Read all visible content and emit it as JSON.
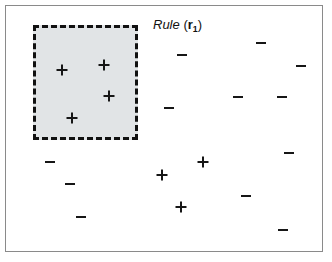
{
  "figure": {
    "width": 332,
    "height": 262,
    "background": "#ffffff",
    "frame": {
      "name": "plot-frame",
      "x": 5,
      "y": 5,
      "width": 318,
      "height": 247,
      "border_color": "#8a8a8a",
      "border_width": 1.5
    }
  },
  "rule_label": {
    "full_text": "Rule (r1)",
    "word": "Rule",
    "open_paren": "(",
    "variable": "r",
    "subscript": "1",
    "close_paren": ")",
    "x": 152,
    "y": 17,
    "font_size": 13,
    "color": "#111111"
  },
  "rule_region": {
    "name": "rule-region-r1",
    "x": 32,
    "y": 24,
    "width": 105,
    "height": 115,
    "fill": "#e1e4e6",
    "border_color": "#111111",
    "border_width": 3,
    "border_style": "dashed"
  },
  "chart_data": {
    "type": "scatter",
    "xlabel": "",
    "ylabel": "",
    "xlim": [
      5,
      323
    ],
    "ylim": [
      5,
      252
    ],
    "grid": false,
    "legend": null,
    "marker_size": 11,
    "marker_stroke": 2,
    "marker_color": "#161616",
    "series": [
      {
        "name": "positive",
        "label": "+",
        "marker": "plus",
        "count": 7,
        "points": [
          {
            "x": 61,
            "y": 69,
            "inside_rule": true
          },
          {
            "x": 103,
            "y": 64,
            "inside_rule": true
          },
          {
            "x": 108,
            "y": 95,
            "inside_rule": true
          },
          {
            "x": 71,
            "y": 117,
            "inside_rule": true
          },
          {
            "x": 161,
            "y": 174,
            "inside_rule": false
          },
          {
            "x": 202,
            "y": 161,
            "inside_rule": false
          },
          {
            "x": 180,
            "y": 206,
            "inside_rule": false
          }
        ]
      },
      {
        "name": "negative",
        "label": "-",
        "marker": "minus",
        "count": 11,
        "points": [
          {
            "x": 181,
            "y": 54,
            "inside_rule": false
          },
          {
            "x": 260,
            "y": 42,
            "inside_rule": false
          },
          {
            "x": 300,
            "y": 65,
            "inside_rule": false
          },
          {
            "x": 237,
            "y": 96,
            "inside_rule": false
          },
          {
            "x": 281,
            "y": 96,
            "inside_rule": false
          },
          {
            "x": 168,
            "y": 107,
            "inside_rule": false
          },
          {
            "x": 288,
            "y": 152,
            "inside_rule": false
          },
          {
            "x": 49,
            "y": 161,
            "inside_rule": false
          },
          {
            "x": 69,
            "y": 183,
            "inside_rule": false
          },
          {
            "x": 245,
            "y": 195,
            "inside_rule": false
          },
          {
            "x": 80,
            "y": 216,
            "inside_rule": false
          },
          {
            "x": 282,
            "y": 229,
            "inside_rule": false
          }
        ]
      }
    ]
  }
}
